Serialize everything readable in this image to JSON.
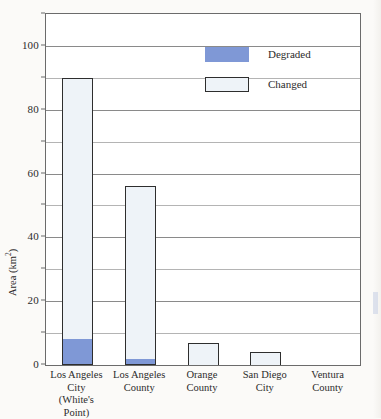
{
  "chart_data": {
    "type": "bar",
    "title": "",
    "xlabel": "",
    "ylabel": "Area (km2)",
    "ylabel_html": "Area (km²)",
    "ylim": [
      0,
      110
    ],
    "ytick_labels": [
      "0",
      "20",
      "40",
      "60",
      "80",
      "100"
    ],
    "ytick_values": [
      0,
      20,
      40,
      60,
      80,
      100
    ],
    "minor_gridline_values": [
      10,
      30,
      50,
      70,
      90,
      110
    ],
    "grid": true,
    "stacked": true,
    "legend_position": "upper right",
    "categories": [
      "Los Angeles\nCity\n(White's Point)",
      "Los Angeles\nCounty",
      "Orange\nCounty",
      "San Diego\nCity",
      "Ventura\nCounty"
    ],
    "series": [
      {
        "name": "Degraded",
        "color": "#7f98d6",
        "values": [
          8,
          2,
          0,
          0,
          0
        ]
      },
      {
        "name": "Changed",
        "color": "#eef3f8",
        "values": [
          82,
          54,
          7,
          4,
          0
        ]
      }
    ],
    "totals": [
      90,
      56,
      7,
      4,
      0
    ]
  },
  "legend": {
    "items": [
      {
        "label": "Degraded",
        "swatch": "degraded-swatch"
      },
      {
        "label": "Changed",
        "swatch": "changed-swatch"
      }
    ]
  },
  "axis": {
    "y_title": "Area (km²)",
    "y_title_unit_base": "Area (km",
    "y_title_unit_sup": "2",
    "y_title_unit_close": ")"
  }
}
